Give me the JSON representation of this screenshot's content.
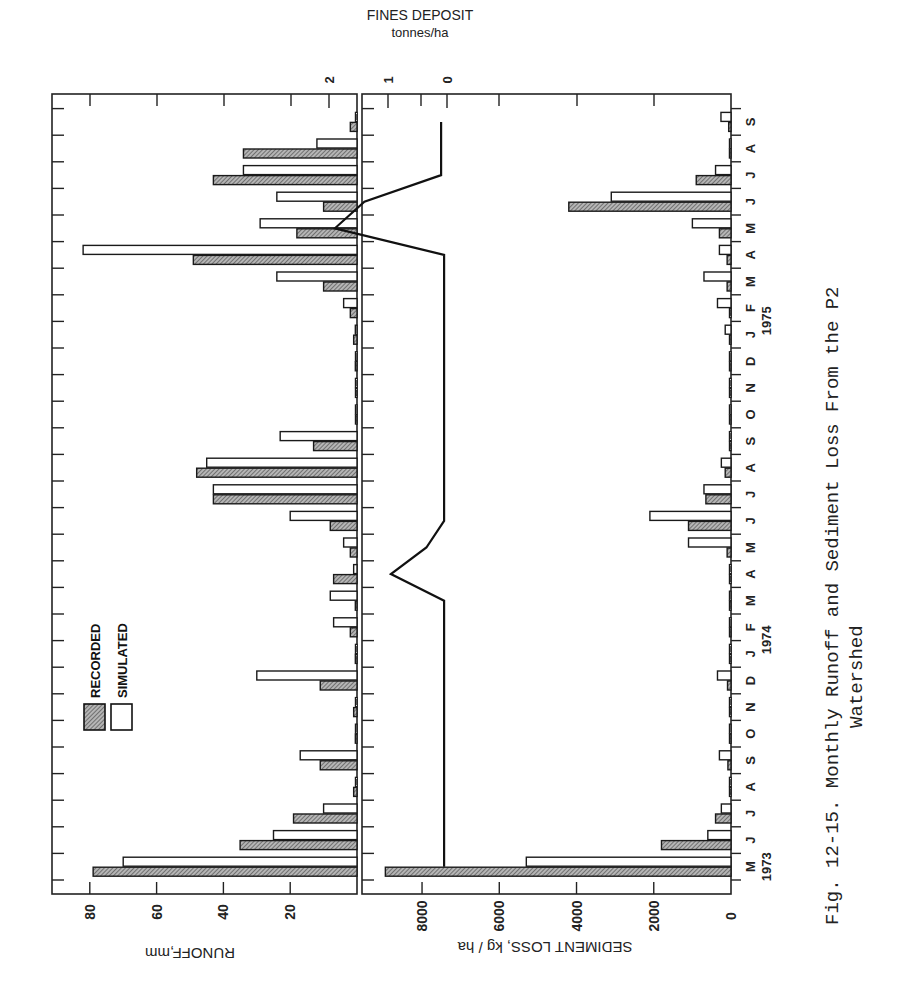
{
  "figure": {
    "caption_line1": "Fig. 12-15.   Monthly Runoff and Sediment Loss From the P2",
    "caption_line2": "Watershed",
    "fines_title": "FINES DEPOSIT",
    "fines_units": "tonnes/ha"
  },
  "chart_data": [
    {
      "type": "bar",
      "title": "Monthly Runoff",
      "orientation": "rotated 90° (months run bottom-to-top, values extend leftward)",
      "xlabel": "Month",
      "ylabel": "RUNOFF, mm",
      "ylim": [
        0,
        88
      ],
      "yticks": [
        20,
        40,
        60,
        80
      ],
      "legend": [
        "RECORDED",
        "SIMULATED"
      ],
      "legend_position": "upper-left of runoff panel",
      "categories": [
        "M",
        "J",
        "J",
        "A",
        "S",
        "O",
        "N",
        "D",
        "J",
        "F",
        "M",
        "A",
        "M",
        "J",
        "J",
        "A",
        "S",
        "O",
        "N",
        "D",
        "J",
        "F",
        "M",
        "A",
        "M",
        "J",
        "J",
        "A",
        "S"
      ],
      "years": [
        {
          "label": "1973",
          "at_index": 0
        },
        {
          "label": "1974",
          "at_index": 8
        },
        {
          "label": "1975",
          "at_index": 20
        }
      ],
      "series": [
        {
          "name": "RECORDED",
          "pattern": "hatched",
          "values": [
            79,
            35,
            19,
            1,
            11,
            0.5,
            1,
            11,
            0.5,
            2,
            0.5,
            7,
            2,
            8,
            43,
            48,
            13,
            0.3,
            0.3,
            0.5,
            1,
            2,
            10,
            49,
            18,
            10,
            43,
            34,
            2,
            12
          ]
        },
        {
          "name": "SIMULATED",
          "pattern": "open",
          "values": [
            70,
            25,
            10,
            0.3,
            17,
            0.3,
            0.3,
            30,
            0.3,
            7,
            8,
            1,
            4,
            20,
            43,
            45,
            23,
            0.3,
            0.3,
            0.3,
            0.5,
            4,
            24,
            82,
            29,
            24,
            34,
            12,
            0.3,
            15
          ]
        }
      ]
    },
    {
      "type": "bar",
      "title": "Monthly Sediment Loss",
      "xlabel": "Month",
      "ylabel": "SEDIMENT LOSS, kg/ha",
      "ylim": [
        0,
        9200
      ],
      "yticks": [
        0,
        2000,
        4000,
        6000,
        8000
      ],
      "categories": [
        "M",
        "J",
        "J",
        "A",
        "S",
        "O",
        "N",
        "D",
        "J",
        "F",
        "M",
        "A",
        "M",
        "J",
        "J",
        "A",
        "S",
        "O",
        "N",
        "D",
        "J",
        "F",
        "M",
        "A",
        "M",
        "J",
        "J",
        "A",
        "S"
      ],
      "series": [
        {
          "name": "RECORDED",
          "pattern": "hatched",
          "values": [
            8950,
            1800,
            400,
            20,
            80,
            20,
            20,
            90,
            20,
            20,
            20,
            20,
            100,
            1100,
            650,
            150,
            20,
            20,
            20,
            20,
            20,
            20,
            100,
            100,
            300,
            4200,
            900,
            40,
            60
          ]
        },
        {
          "name": "SIMULATED",
          "pattern": "open",
          "values": [
            5300,
            600,
            250,
            20,
            300,
            20,
            20,
            350,
            20,
            20,
            20,
            20,
            1100,
            2100,
            700,
            250,
            20,
            20,
            20,
            20,
            150,
            350,
            700,
            300,
            1000,
            3100,
            400,
            20,
            260
          ]
        }
      ]
    },
    {
      "type": "line",
      "title": "Fines Deposit",
      "ylabel": "FINES DEPOSIT tonnes/ha",
      "ylim": [
        0,
        2
      ],
      "yticks": [
        0,
        1,
        2
      ],
      "categories": [
        "M",
        "J",
        "J",
        "A",
        "S",
        "O",
        "N",
        "D",
        "J",
        "F",
        "M",
        "A",
        "M",
        "J",
        "J",
        "A",
        "S",
        "O",
        "N",
        "D",
        "J",
        "F",
        "M",
        "A",
        "M",
        "J",
        "J",
        "A",
        "S"
      ],
      "values": [
        0.05,
        0.05,
        0.05,
        0.05,
        0.05,
        0.05,
        0.05,
        0.05,
        0.05,
        0.05,
        0.05,
        0.95,
        0.35,
        0.05,
        0.05,
        0.05,
        0.05,
        0.05,
        0.05,
        0.05,
        0.05,
        0.05,
        0.05,
        0.05,
        1.9,
        1.4,
        0.1,
        0.1,
        0.1
      ]
    }
  ]
}
